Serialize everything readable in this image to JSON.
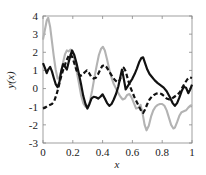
{
  "chart_data": {
    "type": "line",
    "title": "",
    "xlabel": "x",
    "ylabel": "y(x)",
    "xlim": [
      0,
      1
    ],
    "ylim": [
      -3,
      4
    ],
    "grid": false,
    "legend": "none",
    "xticks": [
      0,
      0.2,
      0.4,
      0.6,
      0.8,
      1
    ],
    "xtick_labels": [
      "0",
      "0.2",
      "0.4",
      "0.6",
      "0.8",
      "1"
    ],
    "yticks": [
      -3,
      -2,
      -1,
      0,
      1,
      2,
      3,
      4
    ],
    "ytick_labels": [
      "-3",
      "-2",
      "-1",
      "0",
      "1",
      "2",
      "3",
      "4"
    ],
    "series": [
      {
        "name": "gray-solid",
        "color": "#b3b3b3",
        "style": "solid",
        "width": 2.1,
        "x": [
          0.0,
          0.012,
          0.025,
          0.035,
          0.048,
          0.06,
          0.072,
          0.085,
          0.098,
          0.11,
          0.122,
          0.135,
          0.148,
          0.16,
          0.172,
          0.185,
          0.198,
          0.21,
          0.225,
          0.24,
          0.255,
          0.27,
          0.285,
          0.3,
          0.315,
          0.33,
          0.345,
          0.36,
          0.375,
          0.39,
          0.402,
          0.415,
          0.43,
          0.445,
          0.46,
          0.475,
          0.49,
          0.505,
          0.52,
          0.535,
          0.55,
          0.565,
          0.58,
          0.595,
          0.61,
          0.625,
          0.64,
          0.655,
          0.668,
          0.682,
          0.695,
          0.71,
          0.725,
          0.74,
          0.755,
          0.77,
          0.785,
          0.8,
          0.815,
          0.83,
          0.845,
          0.86,
          0.875,
          0.885,
          0.9,
          0.915,
          0.93,
          0.945,
          0.96,
          0.975,
          0.988,
          1.0
        ],
        "y": [
          2.7,
          3.2,
          3.75,
          3.9,
          3.4,
          2.6,
          1.8,
          1.05,
          0.55,
          0.6,
          0.95,
          1.45,
          1.9,
          2.1,
          2.05,
          2.15,
          2.05,
          1.6,
          1.0,
          0.35,
          -0.35,
          -0.8,
          -1.0,
          -1.02,
          -0.7,
          -0.1,
          0.6,
          1.25,
          1.85,
          2.2,
          2.3,
          2.1,
          1.6,
          1.05,
          0.6,
          0.25,
          0.0,
          -0.25,
          -0.45,
          -0.6,
          -0.55,
          -0.35,
          -0.3,
          -0.5,
          -0.8,
          -1.1,
          -1.05,
          -0.9,
          -1.35,
          -2.0,
          -2.3,
          -2.05,
          -1.55,
          -1.2,
          -1.0,
          -0.9,
          -0.85,
          -0.85,
          -0.95,
          -1.2,
          -1.6,
          -2.0,
          -2.2,
          -2.15,
          -1.85,
          -1.5,
          -1.3,
          -1.25,
          -1.2,
          -1.05,
          -0.95,
          -0.9
        ]
      },
      {
        "name": "black-solid",
        "color": "#111111",
        "style": "solid",
        "width": 2.2,
        "x": [
          0.0,
          0.012,
          0.025,
          0.035,
          0.048,
          0.06,
          0.072,
          0.085,
          0.098,
          0.11,
          0.122,
          0.135,
          0.148,
          0.16,
          0.172,
          0.185,
          0.195,
          0.21,
          0.225,
          0.24,
          0.255,
          0.27,
          0.285,
          0.298,
          0.312,
          0.325,
          0.34,
          0.355,
          0.37,
          0.385,
          0.4,
          0.415,
          0.43,
          0.445,
          0.46,
          0.475,
          0.49,
          0.505,
          0.518,
          0.53,
          0.542,
          0.555,
          0.57,
          0.585,
          0.6,
          0.615,
          0.63,
          0.645,
          0.66,
          0.672,
          0.685,
          0.7,
          0.715,
          0.73,
          0.75,
          0.77,
          0.79,
          0.81,
          0.83,
          0.85,
          0.87,
          0.885,
          0.9,
          0.915,
          0.93,
          0.945,
          0.96,
          0.975,
          0.988,
          1.0
        ],
        "y": [
          1.4,
          1.15,
          0.85,
          1.05,
          1.2,
          0.95,
          0.6,
          0.25,
          0.08,
          0.35,
          0.95,
          1.35,
          1.2,
          1.05,
          1.45,
          1.85,
          2.1,
          1.85,
          1.4,
          0.85,
          0.25,
          -0.4,
          -0.85,
          -1.1,
          -0.85,
          -0.55,
          -0.45,
          -0.48,
          -0.55,
          -0.45,
          -0.32,
          -0.55,
          -0.8,
          -0.95,
          -0.85,
          -0.6,
          -0.3,
          0.1,
          0.6,
          1.05,
          0.55,
          -0.05,
          0.15,
          0.35,
          0.55,
          0.8,
          1.1,
          1.45,
          1.68,
          1.72,
          1.4,
          1.05,
          0.8,
          0.65,
          0.45,
          0.3,
          0.18,
          0.05,
          -0.15,
          -0.45,
          -0.8,
          -0.95,
          -0.8,
          -0.5,
          -0.15,
          0.1,
          0.05,
          -0.25,
          -0.05,
          0.22
        ]
      },
      {
        "name": "black-dashed",
        "color": "#111111",
        "style": "dashed",
        "width": 2.2,
        "x": [
          0.0,
          0.015,
          0.03,
          0.045,
          0.06,
          0.075,
          0.09,
          0.105,
          0.118,
          0.132,
          0.145,
          0.158,
          0.172,
          0.185,
          0.198,
          0.212,
          0.225,
          0.24,
          0.252,
          0.265,
          0.28,
          0.295,
          0.31,
          0.325,
          0.34,
          0.355,
          0.37,
          0.385,
          0.398,
          0.412,
          0.425,
          0.44,
          0.455,
          0.47,
          0.485,
          0.5,
          0.515,
          0.528,
          0.542,
          0.555,
          0.57,
          0.585,
          0.6,
          0.615,
          0.63,
          0.645,
          0.66,
          0.672,
          0.685,
          0.7,
          0.715,
          0.73,
          0.745,
          0.76,
          0.778,
          0.795,
          0.812,
          0.83,
          0.848,
          0.865,
          0.882,
          0.9,
          0.918,
          0.935,
          0.952,
          0.968,
          0.982,
          1.0
        ],
        "y": [
          -1.1,
          -1.05,
          -0.95,
          -0.9,
          -0.85,
          -0.7,
          -0.35,
          0.1,
          0.55,
          0.95,
          1.25,
          1.55,
          1.8,
          1.9,
          1.7,
          1.35,
          1.0,
          0.8,
          0.7,
          0.75,
          0.9,
          1.0,
          0.85,
          0.62,
          0.55,
          0.6,
          0.8,
          1.05,
          1.25,
          1.3,
          1.2,
          1.0,
          0.8,
          0.6,
          0.45,
          0.35,
          0.45,
          0.8,
          1.15,
          0.95,
          0.5,
          0.1,
          -0.2,
          -0.5,
          -0.75,
          -1.0,
          -1.25,
          -1.35,
          -1.15,
          -0.85,
          -0.6,
          -0.45,
          -0.35,
          -0.28,
          -0.25,
          -0.3,
          -0.4,
          -0.55,
          -0.6,
          -0.55,
          -0.45,
          -0.35,
          -0.2,
          0.05,
          0.3,
          0.5,
          0.62,
          0.58
        ]
      }
    ]
  },
  "axis": {
    "x_title": "x",
    "y_title": "y(x)"
  }
}
